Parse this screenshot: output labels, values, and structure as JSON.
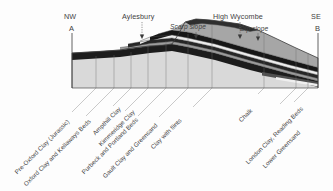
{
  "figure": {
    "kind": "geological-cross-section",
    "orientation_left": "NW",
    "orientation_right": "SE",
    "section_start": "A",
    "section_end": "B"
  },
  "compass": {
    "left": "NW",
    "right": "SE"
  },
  "endpoints": {
    "left": "A",
    "right": "B"
  },
  "places": [
    {
      "name": "Aylesbury",
      "x": 142,
      "label_y": 14,
      "tick_x": 142,
      "tick_top": 22,
      "tick_bottom": 38
    },
    {
      "name": "High Wycombe",
      "x": 240,
      "label_y": 14,
      "tick_x": 240,
      "tick_top": 22,
      "tick_bottom": 40
    }
  ],
  "slope_annotations": [
    {
      "label": "Scarp slope",
      "x": 172,
      "y": 27,
      "tick_x": 196,
      "tick_top": 33,
      "tick_bottom": 41
    },
    {
      "label": "Dip slope",
      "x": 243,
      "y": 28,
      "tick_x": 258,
      "tick_top": 34,
      "tick_bottom": 42
    }
  ],
  "strata": [
    {
      "name": "Pre-Oxford Clay (Jurassic)",
      "color": "#d8d8d8",
      "leader_x": 96,
      "label_x": 18,
      "label_y": 168
    },
    {
      "name": "Oxford Clay and Kellaways Beds",
      "color": "#1d1d1d",
      "leader_x": 114,
      "label_x": 26,
      "label_y": 178
    },
    {
      "name": "Ampthill Clay",
      "color": "#9e9e9e",
      "leader_x": 131,
      "label_x": 93,
      "label_y": 133
    },
    {
      "name": "Kimmeridge Clay",
      "color": "#2b2b2b",
      "leader_x": 148,
      "label_x": 101,
      "label_y": 141
    },
    {
      "name": "Purbeck and Portland Beds",
      "color": "#efefef",
      "leader_x": 166,
      "label_x": 85,
      "label_y": 168
    },
    {
      "name": "Gault Clay and Greensand",
      "color": "#1a1a1a",
      "leader_x": 188,
      "label_x": 106,
      "label_y": 172
    },
    {
      "name": "Clay with flints",
      "color": "#8f8f8f",
      "leader_x": 212,
      "label_x": 152,
      "label_y": 142
    },
    {
      "name": "Chalk",
      "color": "#a8a8a8",
      "leader_x": 264,
      "label_x": 238,
      "label_y": 120
    },
    {
      "name": "London Clay, Reading Beds",
      "color": "#555555",
      "leader_x": 296,
      "label_x": 250,
      "label_y": 159
    },
    {
      "name": "Lower Greensand",
      "color": "#efefef",
      "leader_x": 308,
      "label_x": 268,
      "label_y": 162
    }
  ],
  "palette": {
    "background": "#fdfdfd",
    "ink": "#3f3f3f",
    "outline": "#4a4a4a",
    "base_fill": "#d8d8d8",
    "dark_band": "#1d1d1d",
    "mid_grey": "#9e9e9e",
    "light_band": "#efefef",
    "chalk": "#a8a8a8"
  }
}
